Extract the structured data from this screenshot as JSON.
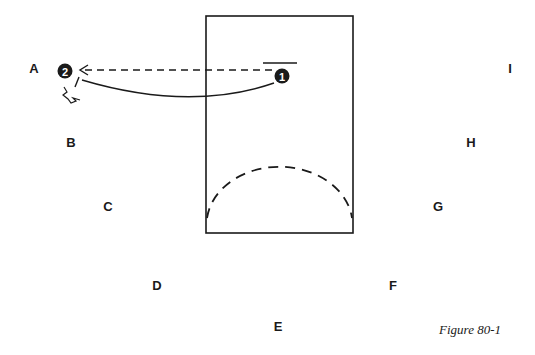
{
  "figure": {
    "caption": "Figure 80-1",
    "court": {
      "x": 206,
      "y": 16,
      "width": 147,
      "height": 217
    },
    "players": [
      {
        "id": "1",
        "label": "1",
        "x": 282,
        "y": 76
      },
      {
        "id": "2",
        "label": "2",
        "x": 65,
        "y": 71
      }
    ],
    "positions": [
      {
        "label": "A",
        "x": 34,
        "y": 68
      },
      {
        "label": "B",
        "x": 71,
        "y": 142
      },
      {
        "label": "C",
        "x": 108,
        "y": 206
      },
      {
        "label": "D",
        "x": 157,
        "y": 285
      },
      {
        "label": "E",
        "x": 278,
        "y": 326
      },
      {
        "label": "F",
        "x": 393,
        "y": 285
      },
      {
        "label": "G",
        "x": 438,
        "y": 206
      },
      {
        "label": "H",
        "x": 471,
        "y": 142
      },
      {
        "label": "I",
        "x": 510,
        "y": 68
      }
    ],
    "colors": {
      "ink": "#1a1a1a",
      "background": "#ffffff"
    }
  }
}
